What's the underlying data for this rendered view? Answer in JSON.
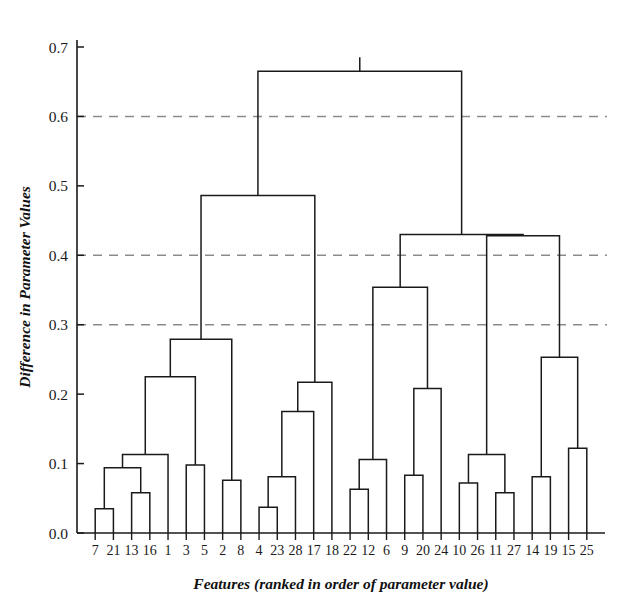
{
  "chart_data": {
    "type": "line",
    "subtype": "dendrogram",
    "title": "",
    "xlabel": "Features (ranked in order of parameter value)",
    "ylabel": "Difference in Parameter Values",
    "ylim": [
      0.0,
      0.73
    ],
    "xlim": [
      0,
      29
    ],
    "yticks": [
      0.0,
      0.1,
      0.2,
      0.3,
      0.4,
      0.5,
      0.6,
      0.7
    ],
    "ytick_labels": [
      "0.0",
      "0.1",
      "0.2",
      "0.3",
      "0.4",
      "0.5",
      "0.6",
      "0.7"
    ],
    "grid": "horizontal-dashed",
    "gridlines": [
      0.3,
      0.4,
      0.6
    ],
    "legend": "none",
    "leaf_order": [
      "7",
      "21",
      "13",
      "16",
      "1",
      "3",
      "5",
      "2",
      "8",
      "4",
      "23",
      "28",
      "17",
      "18",
      "22",
      "12",
      "6",
      "9",
      "20",
      "24",
      "10",
      "26",
      "11",
      "27",
      "14",
      "19",
      "15",
      "25"
    ],
    "n_leaves": 28,
    "line_color": "#1a1a1a",
    "grid_color": "#8a8a8a",
    "merges": [
      {
        "id": "m1",
        "left": "7",
        "right": "21",
        "height": 0.035
      },
      {
        "id": "m2",
        "left": "13",
        "right": "16",
        "height": 0.058
      },
      {
        "id": "m3",
        "left": "m1",
        "right": "m2",
        "height": 0.094
      },
      {
        "id": "m4",
        "left": "m3",
        "right": "1",
        "height": 0.113
      },
      {
        "id": "m5",
        "left": "3",
        "right": "5",
        "height": 0.098
      },
      {
        "id": "m6",
        "left": "m4",
        "right": "m5",
        "height": 0.225
      },
      {
        "id": "m7",
        "left": "2",
        "right": "8",
        "height": 0.076
      },
      {
        "id": "m8",
        "left": "m6",
        "right": "m7",
        "height": 0.279
      },
      {
        "id": "m9",
        "left": "4",
        "right": "23",
        "height": 0.037
      },
      {
        "id": "m10",
        "left": "m9",
        "right": "28",
        "height": 0.081
      },
      {
        "id": "m11",
        "left": "m10",
        "right": "17",
        "height": 0.175
      },
      {
        "id": "m12",
        "left": "m11",
        "right": "18",
        "height": 0.217
      },
      {
        "id": "m13",
        "left": "m8",
        "right": "m12",
        "height": 0.486
      },
      {
        "id": "m14",
        "left": "22",
        "right": "12",
        "height": 0.063
      },
      {
        "id": "m15",
        "left": "m14",
        "right": "6",
        "height": 0.106
      },
      {
        "id": "m16",
        "left": "9",
        "right": "20",
        "height": 0.083
      },
      {
        "id": "m17",
        "left": "m16",
        "right": "24",
        "height": 0.208
      },
      {
        "id": "m18",
        "left": "m15",
        "right": "m17",
        "height": 0.354
      },
      {
        "id": "m19",
        "left": "10",
        "right": "26",
        "height": 0.072
      },
      {
        "id": "m20",
        "left": "11",
        "right": "27",
        "height": 0.058
      },
      {
        "id": "m21",
        "left": "m19",
        "right": "m20",
        "height": 0.113
      },
      {
        "id": "m22",
        "left": "14",
        "right": "19",
        "height": 0.081
      },
      {
        "id": "m23",
        "left": "15",
        "right": "25",
        "height": 0.122
      },
      {
        "id": "m24",
        "left": "m22",
        "right": "m23",
        "height": 0.253
      },
      {
        "id": "m25",
        "left": "m21",
        "right": "m24",
        "height": 0.428
      },
      {
        "id": "m26",
        "left": "m18",
        "right": "m25",
        "height": 0.43
      },
      {
        "id": "m27",
        "left": "m13",
        "right": "m26",
        "height": 0.665
      }
    ]
  },
  "axes": {
    "y_title": "Difference in Parameter Values",
    "x_title": "Features (ranked in order of parameter value)"
  }
}
